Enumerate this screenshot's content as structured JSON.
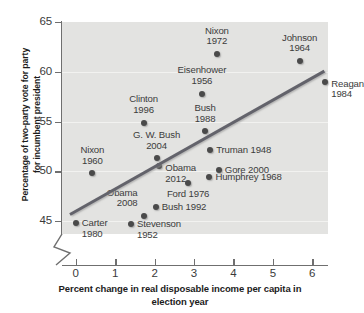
{
  "chart_data": {
    "type": "scatter",
    "title": "",
    "xlabel": "Percent change in real disposable income per capita in election year",
    "ylabel": "Percentage of two-party vote for party for incumbent president",
    "xlabel_lines": [
      "Percent change in real disposable income",
      "per capita in election year"
    ],
    "ylabel_lines": [
      "Percentage of two-party vote for party",
      "for incumbent president"
    ],
    "xlim": [
      -0.35,
      6.4
    ],
    "ylim": [
      43.7,
      65.0
    ],
    "xticks": [
      0,
      1,
      2,
      3,
      4,
      5,
      6
    ],
    "xtick_labels": [
      "0",
      "1",
      "2",
      "3",
      "4",
      "5",
      "6"
    ],
    "yticks": [
      45,
      50,
      55,
      60,
      65
    ],
    "ytick_labels": [
      "45",
      "50",
      "55",
      "60",
      "65"
    ],
    "grid": true,
    "grid_axis": "y",
    "axis_break_y": true,
    "legend": "none",
    "panel_color": "#e3e3e1",
    "marker_color": "#4a4a4a",
    "trendline": {
      "label": "least-squares regression line",
      "x0": -0.15,
      "y0": 45.8,
      "x1": 6.3,
      "y1": 60.2,
      "color": "#63636b"
    },
    "points": [
      {
        "name": "Nixon 1972",
        "label_lines": [
          "Nixon",
          "1972"
        ],
        "x": 3.58,
        "y": 61.8,
        "label_pos": "above-center"
      },
      {
        "name": "Johnson 1964",
        "label_lines": [
          "Johnson",
          "1964"
        ],
        "x": 5.68,
        "y": 61.1,
        "label_pos": "above-center"
      },
      {
        "name": "Eisenhower 1956",
        "label_lines": [
          "Eisenhower",
          "1956"
        ],
        "x": 3.2,
        "y": 57.8,
        "label_pos": "above-center"
      },
      {
        "name": "Reagan 1984",
        "label_lines": [
          "Reagan",
          "1984"
        ],
        "x": 6.33,
        "y": 59.0,
        "label_pos": "below-right"
      },
      {
        "name": "Clinton 1996",
        "label_lines": [
          "Clinton",
          "1996"
        ],
        "x": 1.72,
        "y": 54.9,
        "label_pos": "above-center"
      },
      {
        "name": "Bush 1988",
        "label_lines": [
          "Bush",
          "1988"
        ],
        "x": 3.28,
        "y": 54.0,
        "label_pos": "above-center"
      },
      {
        "name": "G. W. Bush 2004",
        "label_lines": [
          "G. W. Bush",
          "2004"
        ],
        "x": 2.05,
        "y": 51.3,
        "label_pos": "above-center"
      },
      {
        "name": "Nixon 1960",
        "label_lines": [
          "Nixon",
          "1960"
        ],
        "x": 0.42,
        "y": 49.8,
        "label_pos": "above-center"
      },
      {
        "name": "Truman 1948",
        "label_lines": [
          "Truman 1948"
        ],
        "x": 3.41,
        "y": 52.1,
        "label_pos": "right"
      },
      {
        "name": "Gore 2000",
        "label_lines": [
          "Gore 2000"
        ],
        "x": 3.63,
        "y": 50.1,
        "label_pos": "right"
      },
      {
        "name": "Obama 2012",
        "label_lines": [
          "Obama",
          "2012"
        ],
        "x": 2.12,
        "y": 50.5,
        "label_pos": "below-right"
      },
      {
        "name": "Humphrey 1968",
        "label_lines": [
          "Humphrey 1968"
        ],
        "x": 3.39,
        "y": 49.4,
        "label_pos": "right"
      },
      {
        "name": "Ford 1976",
        "label_lines": [
          "Ford 1976"
        ],
        "x": 2.85,
        "y": 48.8,
        "label_pos": "below-center"
      },
      {
        "name": "Bush 1992",
        "label_lines": [
          "Bush 1992"
        ],
        "x": 2.03,
        "y": 46.4,
        "label_pos": "right"
      },
      {
        "name": "Obama 2008",
        "label_lines": [
          "Obama",
          "2008"
        ],
        "x": 1.72,
        "y": 45.5,
        "label_pos": "above-left"
      },
      {
        "name": "Carter 1980",
        "label_lines": [
          "Carter",
          "1980"
        ],
        "x": 0.0,
        "y": 44.8,
        "label_pos": "right-below"
      },
      {
        "name": "Stevenson 1952",
        "label_lines": [
          "Stevenson",
          "1952"
        ],
        "x": 1.4,
        "y": 44.7,
        "label_pos": "right-below"
      }
    ]
  }
}
